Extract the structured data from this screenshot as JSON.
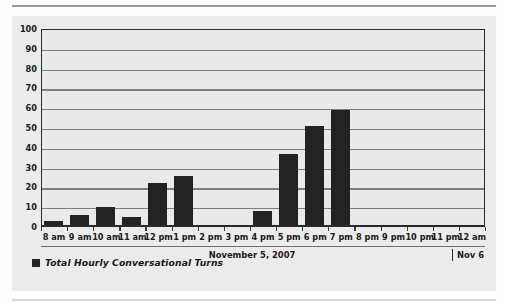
{
  "chart_data": {
    "type": "bar",
    "title": "",
    "subtitle": "",
    "xlabel": "November 5, 2007",
    "ylabel": "",
    "ylim": [
      0,
      100
    ],
    "ytick_step": 10,
    "yticks": [
      100,
      90,
      80,
      70,
      60,
      50,
      40,
      30,
      20,
      10,
      0
    ],
    "grid": true,
    "grid_axis": "y",
    "legend_position": "bottom-left",
    "categories": [
      "8 am",
      "9 am",
      "10 am",
      "11 am",
      "12 pm",
      "1 pm",
      "2 pm",
      "3 pm",
      "4 pm",
      "5 pm",
      "6 pm",
      "7 pm",
      "8 pm",
      "9 pm",
      "10 pm",
      "11 pm",
      "12 am"
    ],
    "series": [
      {
        "name": "Total Hourly Conversational Turns",
        "color": "#232323",
        "values": [
          3,
          6,
          10,
          5,
          22,
          26,
          0,
          0,
          8,
          37,
          51,
          59,
          0,
          0,
          0,
          0,
          0
        ]
      }
    ],
    "annotations": {
      "date_caption": "November 5, 2007",
      "next_day_label": "Nov 6"
    },
    "colors": {
      "bar": "#232323",
      "background": "#e9e9e9",
      "grid": "#7d7d7d",
      "axis": "#2a2a2a",
      "text": "#1a1a1a"
    }
  },
  "legend": {
    "items": [
      {
        "label": "Total Hourly Conversational Turns",
        "color": "#232323"
      }
    ]
  },
  "footer": {
    "date_caption": "November 5, 2007",
    "next_day_label": "Nov 6"
  }
}
